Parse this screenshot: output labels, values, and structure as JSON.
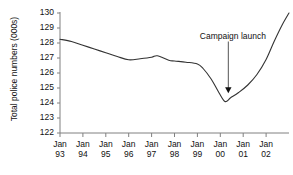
{
  "chart_data": {
    "type": "line",
    "title": "",
    "xlabel": "",
    "ylabel": "Total police numbers (000s)",
    "ylim": [
      122,
      130
    ],
    "xlim": [
      1993.0,
      2003.0
    ],
    "grid": false,
    "legend": "none",
    "y_ticks": [
      130,
      129,
      128,
      127,
      126,
      125,
      124,
      123,
      122
    ],
    "x_ticks": [
      {
        "month": "Jan",
        "year": "93"
      },
      {
        "month": "Jan",
        "year": "94"
      },
      {
        "month": "Jan",
        "year": "95"
      },
      {
        "month": "Jan",
        "year": "96"
      },
      {
        "month": "Jan",
        "year": "97"
      },
      {
        "month": "Jan",
        "year": "98"
      },
      {
        "month": "Jan",
        "year": "99"
      },
      {
        "month": "Jan",
        "year": "00"
      },
      {
        "month": "Jan",
        "year": "01"
      },
      {
        "month": "Jan",
        "year": "02"
      }
    ],
    "series": [
      {
        "name": "Total police numbers",
        "x": [
          1993.0,
          1993.5,
          1994.0,
          1994.5,
          1995.0,
          1995.5,
          1996.0,
          1996.5,
          1997.0,
          1997.25,
          1997.75,
          1998.0,
          1998.5,
          1999.0,
          1999.25,
          1999.6,
          1999.9,
          2000.2,
          2000.45,
          2000.8,
          2001.2,
          2001.6,
          2002.0,
          2002.35,
          2002.7,
          2003.0
        ],
        "y": [
          128.25,
          128.1,
          127.85,
          127.6,
          127.35,
          127.1,
          126.88,
          126.95,
          127.05,
          127.15,
          126.85,
          126.8,
          126.72,
          126.6,
          126.3,
          125.6,
          124.8,
          124.1,
          124.35,
          124.7,
          125.2,
          125.9,
          126.9,
          128.1,
          129.2,
          130.0
        ]
      }
    ],
    "annotations": [
      {
        "text": "Campaign launch",
        "label_x": 2000.55,
        "label_y": 128.5,
        "arrow_from_x": 2000.35,
        "arrow_from_y": 128.1,
        "arrow_to_x": 2000.35,
        "arrow_to_y": 124.65
      }
    ],
    "line_color": "#333333",
    "axis_color": "#808080",
    "text_color": "#111111",
    "background": "#ffffff"
  }
}
